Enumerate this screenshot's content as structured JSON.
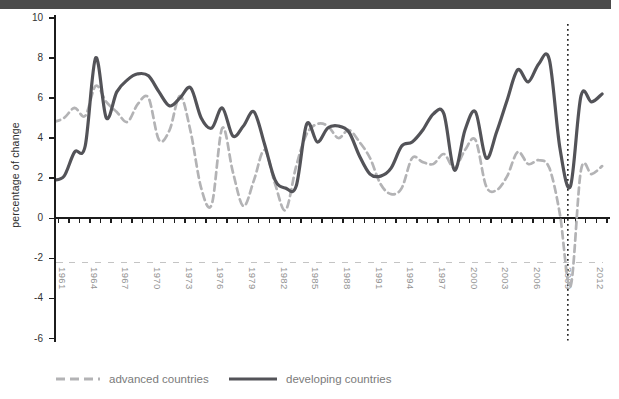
{
  "header": {
    "bar_color": "#4b4b4b"
  },
  "y_axis": {
    "title": "percentage of change",
    "tick_values": [
      10,
      8,
      6,
      4,
      2,
      0,
      -2,
      -4,
      -6
    ]
  },
  "x_axis": {
    "year_labels": [
      "1961",
      "1964",
      "1967",
      "1970",
      "1973",
      "1976",
      "1979",
      "1982",
      "1985",
      "1988",
      "1991",
      "1994",
      "1997",
      "2000",
      "2003",
      "2006",
      "2009",
      "2012"
    ]
  },
  "legend": {
    "items": [
      {
        "label": "advanced countries",
        "color": "#b3b3b5",
        "style": "dashed"
      },
      {
        "label": "developing countries",
        "color": "#535358",
        "style": "solid"
      }
    ]
  },
  "chart_data": {
    "type": "line",
    "title": "",
    "xlabel": "",
    "ylabel": "percentage of change",
    "ylim": [
      -6,
      10
    ],
    "grid": false,
    "legend_position": "bottom",
    "x": [
      1960,
      1961,
      1962,
      1963,
      1964,
      1965,
      1966,
      1967,
      1968,
      1969,
      1970,
      1971,
      1972,
      1973,
      1974,
      1975,
      1976,
      1977,
      1978,
      1979,
      1980,
      1981,
      1982,
      1983,
      1984,
      1985,
      1986,
      1987,
      1988,
      1989,
      1990,
      1991,
      1992,
      1993,
      1994,
      1995,
      1996,
      1997,
      1998,
      1999,
      2000,
      2001,
      2002,
      2003,
      2004,
      2005,
      2006,
      2007,
      2008,
      2009,
      2010,
      2011,
      2012
    ],
    "series": [
      {
        "name": "advanced countries",
        "color": "#b3b3b5",
        "dash": true,
        "values": [
          4.8,
          5.0,
          5.5,
          5.1,
          6.6,
          5.8,
          5.3,
          4.8,
          5.7,
          6.0,
          3.9,
          4.4,
          6.1,
          4.3,
          1.5,
          0.7,
          4.5,
          2.3,
          0.6,
          1.9,
          3.4,
          1.7,
          0.4,
          2.6,
          4.2,
          4.7,
          4.6,
          4.0,
          4.4,
          3.8,
          3.0,
          1.7,
          1.2,
          1.5,
          3.0,
          2.8,
          2.7,
          3.2,
          2.5,
          3.4,
          3.9,
          1.6,
          1.4,
          2.1,
          3.3,
          2.7,
          2.9,
          2.5,
          0.2,
          -3.4,
          2.4,
          2.2,
          2.6
        ]
      },
      {
        "name": "developing countries",
        "color": "#535358",
        "dash": false,
        "values": [
          1.9,
          2.1,
          3.3,
          3.6,
          8.0,
          5.0,
          6.3,
          6.9,
          7.2,
          7.1,
          6.3,
          5.6,
          6.0,
          6.5,
          5.0,
          4.5,
          5.5,
          4.1,
          4.6,
          5.3,
          3.7,
          1.9,
          1.5,
          1.6,
          4.7,
          3.8,
          4.5,
          4.6,
          4.3,
          3.1,
          2.2,
          2.1,
          2.5,
          3.6,
          3.8,
          4.4,
          5.2,
          5.2,
          2.4,
          4.4,
          5.3,
          3.0,
          4.3,
          5.9,
          7.4,
          6.8,
          7.7,
          7.9,
          3.5,
          1.6,
          6.1,
          5.8,
          6.2
        ]
      }
    ],
    "annotations": [
      {
        "type": "vline",
        "x": 2008.75,
        "style": "dotted",
        "color": "#1c1c1c"
      },
      {
        "type": "dashed_label_line",
        "y": -2.2,
        "color": "#c4c4c4"
      }
    ]
  }
}
